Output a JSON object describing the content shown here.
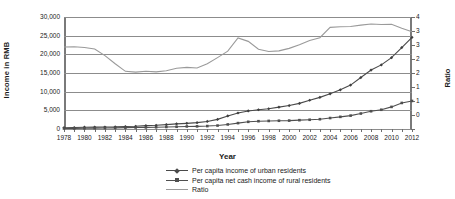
{
  "chart_data": {
    "type": "line",
    "title": "",
    "xlabel": "Year",
    "ylabel": "Income in RMB",
    "y2label": "Ratio",
    "grid": true,
    "legend_position": "bottom",
    "ylim": [
      0,
      30000
    ],
    "y2lim": [
      0,
      4
    ],
    "ytick_labels": [
      "30,000",
      "25,000",
      "20,000",
      "15,000",
      "10,000",
      "5,000",
      "0"
    ],
    "ytick_values": [
      30000,
      25000,
      20000,
      15000,
      10000,
      5000,
      0
    ],
    "y2tick_labels": [
      "4",
      "3",
      "3",
      "2",
      "2",
      "1",
      "1",
      "0"
    ],
    "y2tick_values": [
      4,
      3.5,
      3,
      2.5,
      2,
      1.5,
      1,
      0.5,
      0
    ],
    "x": [
      1978,
      1979,
      1980,
      1981,
      1982,
      1983,
      1984,
      1985,
      1986,
      1987,
      1988,
      1989,
      1990,
      1991,
      1992,
      1993,
      1994,
      1995,
      1996,
      1997,
      1998,
      1999,
      2000,
      2001,
      2002,
      2003,
      2004,
      2005,
      2006,
      2007,
      2008,
      2009,
      2010,
      2011,
      2012
    ],
    "xtick_labels": [
      "1978",
      "1980",
      "1982",
      "1984",
      "1986",
      "1988",
      "1990",
      "1992",
      "1994",
      "1996",
      "1998",
      "2000",
      "2002",
      "2004",
      "2006",
      "2008",
      "2010",
      "2012"
    ],
    "series": [
      {
        "name": "Per capita income of urban residents",
        "axis": "left",
        "color": "#4a4a4a",
        "marker": "diamond",
        "values": [
          343,
          387,
          478,
          500,
          535,
          565,
          660,
          739,
          900,
          1002,
          1181,
          1376,
          1510,
          1701,
          2027,
          2577,
          3496,
          4283,
          4839,
          5160,
          5425,
          5854,
          6280,
          6860,
          7703,
          8472,
          9422,
          10493,
          11760,
          13786,
          15781,
          17175,
          19109,
          21810,
          24565
        ]
      },
      {
        "name": "Per capita net cash income of rural residents",
        "axis": "left",
        "color": "#4f4f4f",
        "marker": "square",
        "values": [
          134,
          160,
          191,
          223,
          270,
          310,
          355,
          398,
          424,
          463,
          545,
          602,
          686,
          709,
          784,
          922,
          1221,
          1578,
          1926,
          2090,
          2162,
          2210,
          2253,
          2366,
          2476,
          2622,
          2936,
          3255,
          3587,
          4140,
          4761,
          5153,
          5919,
          6977,
          7517
        ]
      },
      {
        "name": "Ratio",
        "axis": "right",
        "color": "#9a9a9a",
        "marker": "none",
        "values": [
          2.93,
          2.94,
          2.91,
          2.86,
          2.62,
          2.33,
          2.06,
          2.03,
          2.06,
          2.04,
          2.08,
          2.17,
          2.2,
          2.18,
          2.33,
          2.55,
          2.78,
          3.25,
          3.13,
          2.85,
          2.77,
          2.79,
          2.88,
          3.01,
          3.16,
          3.26,
          3.63,
          3.65,
          3.66,
          3.71,
          3.75,
          3.73,
          3.74,
          3.6,
          3.47
        ]
      }
    ]
  },
  "legend": {
    "items": [
      {
        "label": "Per capita income of urban  residents",
        "marker": "diamond-line",
        "color": "#4a4a4a"
      },
      {
        "label": "Per capita net cash income of rural residents",
        "marker": "square-line",
        "color": "#4f4f4f"
      },
      {
        "label": "Ratio",
        "marker": "line",
        "color": "#9a9a9a"
      }
    ]
  }
}
